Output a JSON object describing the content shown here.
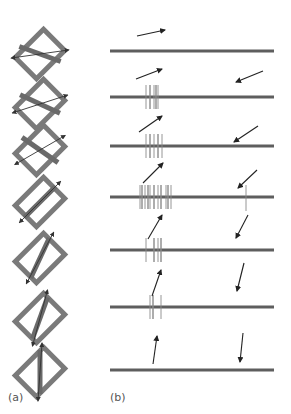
{
  "figure": {
    "panel_labels": {
      "a": "(a)",
      "b": "(b)"
    },
    "colors": {
      "frame": "#7a7a7a",
      "bar": "#6a6a6a",
      "baseline": "#5e5e5e",
      "spike": "#8a8a8a",
      "arrow": "#222222"
    },
    "panel_a": {
      "description": "Rotated rectangular receptive fields with inner bar; double-headed arrow shows stimulus orientation",
      "rows": [
        {
          "cy": 54,
          "frame_angle": 45,
          "bar_angle": -70,
          "arrow_angle": -8
        },
        {
          "cy": 104,
          "frame_angle": 45,
          "bar_angle": -65,
          "arrow_angle": -18
        },
        {
          "cy": 150,
          "frame_angle": 45,
          "bar_angle": -55,
          "arrow_angle": -30
        },
        {
          "cy": 202,
          "frame_angle": 45,
          "bar_angle": 45,
          "arrow_angle": -45
        },
        {
          "cy": 258,
          "frame_angle": 45,
          "bar_angle": 25,
          "arrow_angle": -62
        },
        {
          "cy": 318,
          "frame_angle": 45,
          "bar_angle": 20,
          "arrow_angle": -75
        },
        {
          "cy": 372,
          "frame_angle": 45,
          "bar_angle": 0,
          "arrow_angle": -86
        }
      ]
    },
    "panel_b": {
      "description": "Spike trains for stimulus moving in each direction",
      "line_x1": 110,
      "line_x2": 274,
      "rows": [
        {
          "y": 51,
          "left_arrow": {
            "x1": 137,
            "y1": 36,
            "x2": 165,
            "y2": 30
          },
          "right_arrow": null,
          "spikes": []
        },
        {
          "y": 97,
          "left_arrow": {
            "x1": 136,
            "y1": 79,
            "x2": 162,
            "y2": 69
          },
          "right_arrow": {
            "x1": 263,
            "y1": 71,
            "x2": 236,
            "y2": 82
          },
          "spikes": [
            146,
            150,
            154,
            156,
            158
          ]
        },
        {
          "y": 146,
          "left_arrow": {
            "x1": 139,
            "y1": 132,
            "x2": 162,
            "y2": 116
          },
          "right_arrow": {
            "x1": 258,
            "y1": 126,
            "x2": 234,
            "y2": 142
          },
          "spikes": [
            146,
            150,
            154,
            158,
            162
          ]
        },
        {
          "y": 197,
          "left_arrow": {
            "x1": 143,
            "y1": 183,
            "x2": 163,
            "y2": 163
          },
          "right_arrow": {
            "x1": 257,
            "y1": 170,
            "x2": 238,
            "y2": 188
          },
          "spikes": [
            140,
            142,
            145,
            148,
            150,
            154,
            158,
            161,
            166,
            168,
            171
          ],
          "right_spikes": [
            246
          ]
        },
        {
          "y": 250,
          "left_arrow": {
            "x1": 148,
            "y1": 239,
            "x2": 162,
            "y2": 215
          },
          "right_arrow": {
            "x1": 248,
            "y1": 215,
            "x2": 236,
            "y2": 238
          },
          "spikes": [
            146,
            154,
            158,
            161
          ]
        },
        {
          "y": 307,
          "left_arrow": {
            "x1": 152,
            "y1": 296,
            "x2": 161,
            "y2": 270
          },
          "right_arrow": {
            "x1": 244,
            "y1": 263,
            "x2": 237,
            "y2": 291
          },
          "spikes": [
            150,
            153,
            161
          ]
        },
        {
          "y": 370,
          "left_arrow": {
            "x1": 153,
            "y1": 364,
            "x2": 157,
            "y2": 336
          },
          "right_arrow": {
            "x1": 243,
            "y1": 333,
            "x2": 240,
            "y2": 362
          },
          "spikes": []
        }
      ]
    }
  }
}
